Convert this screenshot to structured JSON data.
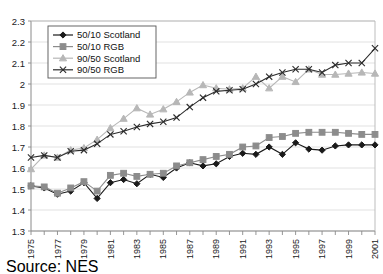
{
  "source": {
    "label": "Source: NES"
  },
  "chart_data": {
    "type": "line",
    "title": "",
    "subtitle": "",
    "xlabel": "",
    "ylabel": "",
    "xlim": [
      1975,
      2001
    ],
    "ylim": [
      1.3,
      2.3
    ],
    "ytick_step": 0.1,
    "grid": true,
    "grid_axis": "y",
    "legend_position": "top-left",
    "yticks": [
      "2.3",
      "2.2",
      "2.1",
      "2",
      "1.9",
      "1.8",
      "1.7",
      "1.6",
      "1.5",
      "1.4",
      "1.3"
    ],
    "ytick_values": [
      2.3,
      2.2,
      2.1,
      2.0,
      1.9,
      1.8,
      1.7,
      1.6,
      1.5,
      1.4,
      1.3
    ],
    "x": [
      1975,
      1976,
      1977,
      1978,
      1979,
      1980,
      1981,
      1982,
      1983,
      1984,
      1985,
      1986,
      1987,
      1988,
      1989,
      1990,
      1991,
      1992,
      1993,
      1994,
      1995,
      1996,
      1997,
      1998,
      1999,
      2000,
      2001
    ],
    "xtick_labels": [
      "1975",
      "1977",
      "1979",
      "1981",
      "1983",
      "1985",
      "1987",
      "1989",
      "1991",
      "1993",
      "1995",
      "1997",
      "1999",
      "2001"
    ],
    "xtick_label_values": [
      1975,
      1977,
      1979,
      1981,
      1983,
      1985,
      1987,
      1989,
      1991,
      1993,
      1995,
      1997,
      1999,
      2001
    ],
    "series": [
      {
        "name": "50/10 Scotland",
        "marker": "diamond",
        "color": "#1a1a1a",
        "values": [
          1.515,
          1.505,
          1.475,
          1.49,
          1.53,
          1.455,
          1.53,
          1.545,
          1.525,
          1.57,
          1.555,
          1.6,
          1.625,
          1.61,
          1.62,
          1.655,
          1.67,
          1.665,
          1.7,
          1.665,
          1.72,
          1.69,
          1.685,
          1.705,
          1.71,
          1.71,
          1.71
        ]
      },
      {
        "name": "50/10 RGB",
        "marker": "square",
        "color": "#8c8c8c",
        "values": [
          1.515,
          1.51,
          1.48,
          1.505,
          1.535,
          1.49,
          1.565,
          1.575,
          1.56,
          1.57,
          1.575,
          1.61,
          1.625,
          1.64,
          1.655,
          1.665,
          1.7,
          1.705,
          1.745,
          1.75,
          1.765,
          1.77,
          1.77,
          1.77,
          1.765,
          1.76,
          1.76
        ]
      },
      {
        "name": "90/50 Scotland",
        "marker": "triangle",
        "color": "#b7b7b7",
        "values": [
          1.595,
          1.66,
          1.65,
          1.685,
          1.695,
          1.735,
          1.79,
          1.835,
          1.885,
          1.855,
          1.88,
          1.915,
          1.96,
          1.995,
          1.98,
          1.975,
          1.98,
          2.035,
          1.98,
          2.035,
          2.01,
          2.07,
          2.045,
          2.045,
          2.05,
          2.055,
          2.05
        ]
      },
      {
        "name": "90/50 RGB",
        "marker": "cross",
        "color": "#2b2b2b",
        "values": [
          1.65,
          1.66,
          1.65,
          1.68,
          1.685,
          1.715,
          1.76,
          1.775,
          1.795,
          1.81,
          1.82,
          1.84,
          1.89,
          1.935,
          1.965,
          1.97,
          1.975,
          2.0,
          2.035,
          2.055,
          2.07,
          2.07,
          2.055,
          2.09,
          2.1,
          2.1,
          2.17
        ]
      }
    ]
  }
}
